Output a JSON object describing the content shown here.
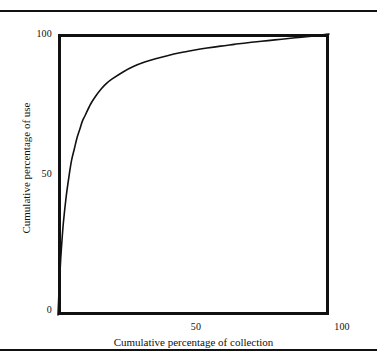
{
  "figure": {
    "background_color": "#ffffff",
    "ink_color": "#111111",
    "rules": {
      "top_label": "page-rule-top",
      "bottom_label": "page-rule-bottom"
    }
  },
  "chart_data": {
    "type": "line",
    "title": "",
    "subtitle": "",
    "xlabel": "Cumulative percentage of collection",
    "ylabel": "Cumulative percentage of use",
    "xlim": [
      0,
      100
    ],
    "ylim": [
      0,
      100
    ],
    "xticks": [
      0,
      50,
      100
    ],
    "yticks": [
      0,
      50,
      100
    ],
    "xtick_labels": [
      "",
      "50",
      "100"
    ],
    "ytick_labels": [
      "0",
      "50",
      "100"
    ],
    "grid": false,
    "legend": false,
    "legend_position": "none",
    "annotations": [],
    "series": [
      {
        "name": "Cumulative use curve",
        "color": "#111111",
        "line_width": 1.6,
        "x": [
          0,
          0.5,
          1,
          1.5,
          2,
          3,
          4,
          5,
          6,
          7,
          8,
          9,
          10,
          12,
          14,
          16,
          18,
          20,
          24,
          28,
          32,
          36,
          40,
          45,
          50,
          55,
          60,
          65,
          70,
          75,
          80,
          85,
          90,
          95,
          100
        ],
        "y": [
          0,
          11,
          20,
          27,
          33,
          42,
          49,
          55,
          59,
          63,
          66,
          69,
          71,
          75,
          78,
          80.5,
          82.5,
          84,
          86.5,
          88.5,
          90,
          91.2,
          92.2,
          93.3,
          94.2,
          95,
          95.7,
          96.3,
          96.9,
          97.4,
          97.9,
          98.4,
          98.9,
          99.4,
          100
        ]
      }
    ]
  },
  "axes": {
    "y_ticks": [
      {
        "value": "100"
      },
      {
        "value": "50"
      },
      {
        "value": "0"
      }
    ],
    "x_ticks": [
      {
        "value": "50"
      },
      {
        "value": "100"
      }
    ],
    "x_title": "Cumulative percentage of collection",
    "y_title": "Cumulative percentage of use"
  }
}
